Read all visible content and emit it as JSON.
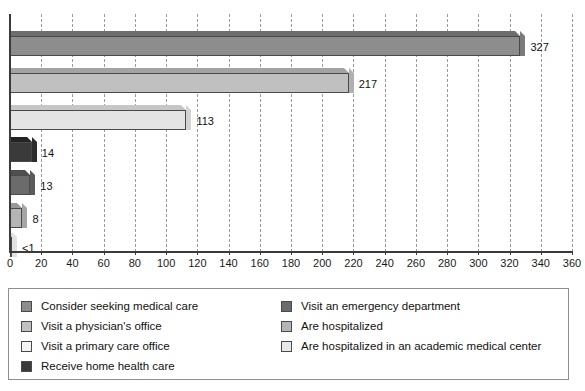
{
  "chart_data": {
    "type": "bar",
    "orientation": "horizontal",
    "title": "",
    "subtitle": "",
    "xlabel": "",
    "ylabel": "",
    "xlim": [
      0,
      360
    ],
    "xticks": [
      0,
      20,
      40,
      60,
      80,
      100,
      120,
      140,
      160,
      180,
      200,
      220,
      240,
      260,
      280,
      300,
      320,
      340,
      360
    ],
    "grid": "vertical-dashed",
    "legend_position": "bottom",
    "categories": [
      "Consider seeking medical care",
      "Visit a physician's office",
      "Visit a primary care office",
      "Visit an emergency department",
      "Receive home health care",
      "Are hospitalized",
      "Are hospitalized in an academic medical center"
    ],
    "values": [
      327,
      217,
      113,
      14,
      13,
      8,
      0.5
    ],
    "value_labels": [
      "327",
      "217",
      "113",
      "14",
      "13",
      "8",
      "<1"
    ],
    "bars": [
      {
        "label": "Consider seeking medical care",
        "value": 327,
        "value_label": "327",
        "color": "#8d8d8d",
        "top_color": "#6e6e6e",
        "side_color": "#7b7b7b"
      },
      {
        "label": "Visit a physician's office",
        "value": 217,
        "value_label": "217",
        "color": "#c0c0c0",
        "top_color": "#a3a3a3",
        "side_color": "#b0b0b0"
      },
      {
        "label": "Visit a primary care office",
        "value": 113,
        "value_label": "113",
        "color": "#e4e4e4",
        "top_color": "#c6c6c6",
        "side_color": "#d4d4d4"
      },
      {
        "label": "Visit an emergency department",
        "value": 14,
        "value_label": "14",
        "color": "#3a3a3a",
        "top_color": "#232323",
        "side_color": "#2d2d2d"
      },
      {
        "label": "Receive home health care",
        "value": 13,
        "value_label": "13",
        "color": "#6b6b6b",
        "top_color": "#4e4e4e",
        "side_color": "#5b5b5b"
      },
      {
        "label": "Are hospitalized",
        "value": 8,
        "value_label": "8",
        "color": "#b5b5b5",
        "top_color": "#989898",
        "side_color": "#a5a5a5"
      },
      {
        "label": "Are hospitalized in an academic medical center",
        "value": 0.5,
        "value_label": "<1",
        "color": "#f2f2f2",
        "top_color": "#d6d6d6",
        "side_color": "#e2e2e2"
      }
    ]
  },
  "legend": {
    "columns": [
      {
        "items": [
          {
            "label": "Consider seeking medical care",
            "color": "#8d8d8d"
          },
          {
            "label": "Visit a physician's office",
            "color": "#c0c0c0"
          },
          {
            "label": "Visit a primary care office",
            "color": "#f4f4f4"
          },
          {
            "label": "Receive home health care",
            "color": "#3a3a3a"
          }
        ]
      },
      {
        "items": [
          {
            "label": "Visit an emergency department",
            "color": "#6b6b6b"
          },
          {
            "label": "Are hospitalized",
            "color": "#b5b5b5"
          },
          {
            "label": "Are hospitalized in an academic medical center",
            "color": "#e8e8e8"
          }
        ]
      }
    ]
  },
  "colors": {
    "axis": "#3b3b3b",
    "gridline": "#9a9a9a",
    "text": "#111111",
    "legend_border": "#8e8e8e",
    "background": "#ffffff"
  }
}
